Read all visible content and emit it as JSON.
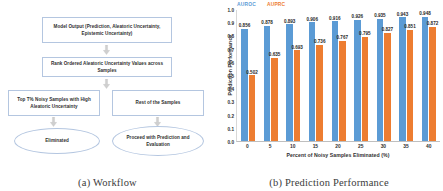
{
  "figure": {
    "panel_a": {
      "caption": "(a) Workflow",
      "nodes": {
        "model_output": "Model Output (Prediction, Aleatoric Uncertainty, Epistemic Uncertainty)",
        "rank_ordered": "Rank Ordered Aleatoric Uncertainty Values across Samples",
        "top_noisy": "Top T% Noisy Samples with High Aleatoric Uncertainty",
        "rest_samples": "Rest of the Samples",
        "eliminated": "Eliminated",
        "proceed": "Proceed with Prediction and Evaluation"
      },
      "icons": {
        "arrow": "arrow-down-icon"
      }
    },
    "panel_b": {
      "caption": "(b) Prediction Performance"
    }
  },
  "chart_data": {
    "type": "bar",
    "title": "",
    "xlabel": "Percent of Noisy Samples Eliminated (%)",
    "ylabel": "Prediction Performance",
    "categories": [
      "0",
      "5",
      "10",
      "15",
      "20",
      "25",
      "30",
      "35",
      "40"
    ],
    "ylim": [
      0.0,
      1.0
    ],
    "yticks": [
      "1.0",
      "0.9",
      "0.8",
      "0.7",
      "0.6",
      "0.5",
      "0.4",
      "0.3",
      "0.2",
      "0.1",
      "0.0"
    ],
    "grid": false,
    "legend_position": "top-left",
    "series": [
      {
        "name": "AUROC",
        "color": "#5b9bd5",
        "values": [
          0.856,
          0.878,
          0.893,
          0.906,
          0.916,
          0.926,
          0.935,
          0.943,
          0.948
        ],
        "labels": [
          "0.856",
          "0.878",
          "0.893",
          "0.906",
          "0.916",
          "0.926",
          "0.935",
          "0.943",
          "0.948"
        ]
      },
      {
        "name": "AUPRC",
        "color": "#ed7d31",
        "values": [
          0.502,
          0.635,
          0.693,
          0.736,
          0.767,
          0.795,
          0.827,
          0.851,
          0.872
        ],
        "labels": [
          "0.502",
          "0.635",
          "0.693",
          "0.736",
          "0.767",
          "0.795",
          "0.827",
          "0.851",
          "0.872"
        ]
      }
    ]
  }
}
